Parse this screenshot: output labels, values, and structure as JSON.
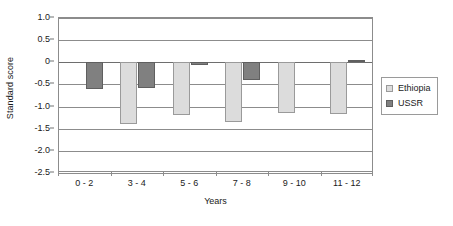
{
  "chart_data": {
    "type": "bar",
    "title": "",
    "subtitle": "",
    "xlabel": "Years",
    "ylabel": "Standard score",
    "categories": [
      "0 - 2",
      "3 - 4",
      "5 - 6",
      "7 - 8",
      "9 - 10",
      "11 - 12"
    ],
    "series": [
      {
        "name": "Ethiopia",
        "color": "#dcdcdc",
        "values": [
          0,
          -1.4,
          -1.18,
          -1.34,
          -1.15,
          -1.17
        ]
      },
      {
        "name": "USSR",
        "color": "#808080",
        "values": [
          -0.61,
          -0.59,
          -0.07,
          -0.41,
          0,
          0.06
        ]
      }
    ],
    "ylim": [
      -2.5,
      1.0
    ],
    "ytick_labels": [
      "1.0",
      "0.5",
      "0",
      "-0.5",
      "-1.0",
      "-1.5",
      "-2.0",
      "-2.5"
    ],
    "ytick_values": [
      1.0,
      0.5,
      0,
      -0.5,
      -1.0,
      -1.5,
      -2.0,
      -2.5
    ],
    "grid": true,
    "legend_position": "right",
    "zero_line_value": 0
  },
  "legend": {
    "items": [
      {
        "label": "Ethiopia",
        "swatch": "ethiopia"
      },
      {
        "label": "USSR",
        "swatch": "ussr"
      }
    ]
  }
}
